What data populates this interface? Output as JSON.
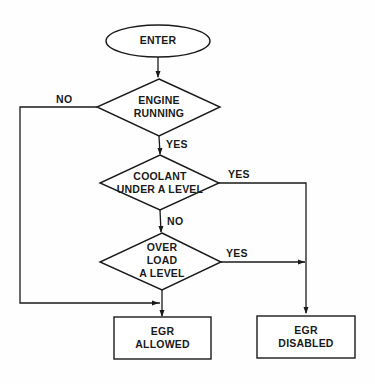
{
  "diagram": {
    "type": "flowchart",
    "nodes": {
      "enter": {
        "shape": "ellipse",
        "lines": [
          "ENTER"
        ]
      },
      "engine_running": {
        "shape": "diamond",
        "lines": [
          "ENGINE",
          "RUNNING"
        ]
      },
      "coolant": {
        "shape": "diamond",
        "lines": [
          "COOLANT",
          "UNDER A LEVEL"
        ]
      },
      "overload": {
        "shape": "diamond",
        "lines": [
          "OVER",
          "LOAD",
          "A LEVEL"
        ]
      },
      "egr_allowed": {
        "shape": "rectangle",
        "lines": [
          "EGR",
          "ALLOWED"
        ]
      },
      "egr_disabled": {
        "shape": "rectangle",
        "lines": [
          "EGR",
          "DISABLED"
        ]
      }
    },
    "edge_labels": {
      "engine_no": "NO",
      "engine_yes": "YES",
      "coolant_yes": "YES",
      "coolant_no": "NO",
      "overload_yes": "YES"
    },
    "edges": [
      {
        "from": "enter",
        "to": "engine_running",
        "label": ""
      },
      {
        "from": "engine_running",
        "to": "egr_allowed",
        "label": "NO"
      },
      {
        "from": "engine_running",
        "to": "coolant",
        "label": "YES"
      },
      {
        "from": "coolant",
        "to": "egr_disabled",
        "label": "YES"
      },
      {
        "from": "coolant",
        "to": "overload",
        "label": "NO"
      },
      {
        "from": "overload",
        "to": "egr_disabled",
        "label": "YES"
      },
      {
        "from": "overload",
        "to": "egr_allowed",
        "label": ""
      }
    ],
    "colors": {
      "stroke": "#1a1a1a",
      "background": "#fefefe"
    }
  }
}
